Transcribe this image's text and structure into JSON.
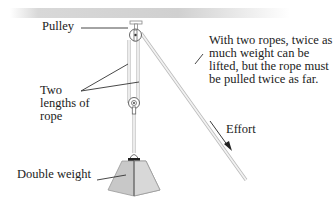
{
  "diagram": {
    "type": "double-pulley system",
    "labels": {
      "pulley": "Pulley",
      "ropes": "Two lengths of rope",
      "weight": "Double weight",
      "description": "With two ropes, twice as much weight can be lifted, but the rope must be pulled twice as far.",
      "effort": "Effort"
    },
    "colors": {
      "ceiling": "#d0d0d0",
      "rope": "#e4e4e4",
      "rope_outline": "#b8b8b8",
      "weight_fill": "#c8c8c8",
      "leader_line": "#333333"
    }
  }
}
